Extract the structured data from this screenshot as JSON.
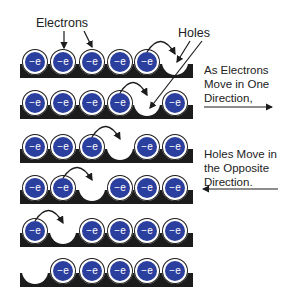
{
  "labels": {
    "electrons": "Electrons",
    "holes": "Holes",
    "electron_direction": [
      "As Electrons",
      "Move in One",
      "Direction,"
    ],
    "hole_direction": [
      "Holes Move in",
      "the Opposite",
      "Direction."
    ]
  },
  "electron_symbol": "−e",
  "colors": {
    "electron": "#2b3f9e",
    "bar": "#1c1c1c",
    "hole": "#ffffff"
  },
  "rows": [
    {
      "slots": [
        "e",
        "e",
        "e",
        "e",
        "e",
        "hole"
      ],
      "hop_from": 4
    },
    {
      "slots": [
        "e",
        "e",
        "e",
        "e",
        "hole",
        "e"
      ],
      "hop_from": 3
    },
    {
      "slots": [
        "e",
        "e",
        "e",
        "hole",
        "e",
        "e"
      ],
      "hop_from": 2
    },
    {
      "slots": [
        "e",
        "e",
        "hole",
        "e",
        "e",
        "e"
      ],
      "hop_from": 1
    },
    {
      "slots": [
        "e",
        "hole",
        "e",
        "e",
        "e",
        "e"
      ],
      "hop_from": 0
    },
    {
      "slots": [
        "hole",
        "e",
        "e",
        "e",
        "e",
        "e"
      ],
      "hop_from": null
    }
  ]
}
